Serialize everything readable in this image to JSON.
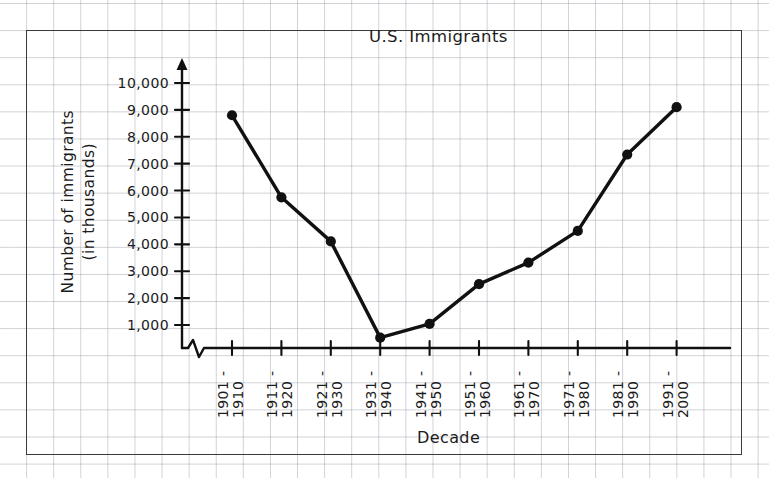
{
  "chart_data": {
    "type": "line",
    "title": "U.S. Immigrants",
    "xlabel": "Decade",
    "ylabel_line1": "Number of immigrants",
    "ylabel_line2": "(in thousands)",
    "categories": [
      "1901 - 1910",
      "1911 - 1920",
      "1921 - 1930",
      "1931 - 1940",
      "1941 - 1950",
      "1951 - 1960",
      "1961 - 1970",
      "1971 - 1980",
      "1981 - 1990",
      "1991 - 2000"
    ],
    "category_lines": [
      {
        "start": "1901 -",
        "end": "1910"
      },
      {
        "start": "1911 -",
        "end": "1920"
      },
      {
        "start": "1921 -",
        "end": "1930"
      },
      {
        "start": "1931 -",
        "end": "1940"
      },
      {
        "start": "1941 -",
        "end": "1950"
      },
      {
        "start": "1951 -",
        "end": "1960"
      },
      {
        "start": "1961 -",
        "end": "1970"
      },
      {
        "start": "1971 -",
        "end": "1980"
      },
      {
        "start": "1981 -",
        "end": "1990"
      },
      {
        "start": "1991 -",
        "end": "2000"
      }
    ],
    "values": [
      8800,
      5750,
      4110,
      530,
      1040,
      2520,
      3320,
      4500,
      7340,
      9100
    ],
    "ylim": [
      0,
      10000
    ],
    "ytick_values": [
      1000,
      2000,
      3000,
      4000,
      5000,
      6000,
      7000,
      8000,
      9000,
      10000
    ],
    "ytick_labels": [
      "1,000",
      "2,000",
      "3,000",
      "4,000",
      "5,000",
      "6,000",
      "7,000",
      "8,000",
      "9,000",
      "10,000"
    ],
    "grid": true,
    "legend": "none",
    "y_axis_break": true,
    "series_color": "#111111",
    "grid_color": "#969ba5",
    "marker": "filled-circle"
  }
}
